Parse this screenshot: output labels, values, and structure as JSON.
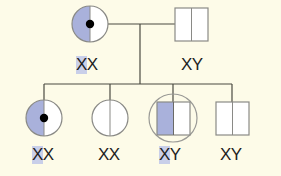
{
  "colors": {
    "background": "#fdfbe8",
    "line": "#4a4a40",
    "outline": "#8a8a86",
    "shade": "#a9b1db",
    "fill": "#ffffff",
    "dot": "#000000",
    "highlight": "#c9cfe9"
  },
  "pedigree": {
    "generation1": [
      {
        "id": "mother",
        "shape": "circle",
        "sex": "female",
        "left_half_shaded": true,
        "carrier_dot": true,
        "genotype": "XX",
        "highlight_first": true
      },
      {
        "id": "father",
        "shape": "square",
        "sex": "male",
        "left_half_shaded": false,
        "carrier_dot": false,
        "genotype": "XY",
        "highlight_first": false
      }
    ],
    "generation2": [
      {
        "id": "daughter-1",
        "shape": "circle",
        "sex": "female",
        "left_half_shaded": true,
        "carrier_dot": true,
        "genotype": "XX",
        "highlight_first": true
      },
      {
        "id": "daughter-2",
        "shape": "circle",
        "sex": "female",
        "left_half_shaded": false,
        "carrier_dot": false,
        "genotype": "XX",
        "highlight_first": false
      },
      {
        "id": "son-1",
        "shape": "square",
        "sex": "male",
        "left_half_shaded": true,
        "carrier_dot": false,
        "encircled": true,
        "genotype": "XY",
        "highlight_first": true
      },
      {
        "id": "son-2",
        "shape": "square",
        "sex": "male",
        "left_half_shaded": false,
        "carrier_dot": false,
        "genotype": "XY",
        "highlight_first": false
      }
    ]
  },
  "labels": {
    "mother": {
      "first": "X",
      "rest": "X"
    },
    "father": {
      "first": "X",
      "rest": "Y"
    },
    "daughter1": {
      "first": "X",
      "rest": "X"
    },
    "daughter2": {
      "first": "X",
      "rest": "X"
    },
    "son1": {
      "first": "X",
      "rest": "Y"
    },
    "son2": {
      "first": "X",
      "rest": "Y"
    }
  }
}
